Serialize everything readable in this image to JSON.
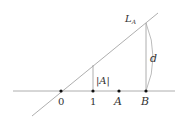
{
  "diagram": {
    "line_label_main": "L",
    "line_label_sub": "A",
    "points": [
      {
        "label": "0",
        "x": 61
      },
      {
        "label": "1",
        "x": 93
      },
      {
        "label": "A",
        "x": 119
      },
      {
        "label": "B",
        "x": 146
      }
    ],
    "segment_label_abs": "|A|",
    "distance_label": "d",
    "colors": {
      "stroke": "#999999",
      "dot": "#111111",
      "text": "#333333"
    }
  }
}
